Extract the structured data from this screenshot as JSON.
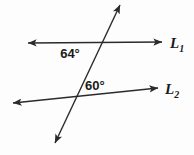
{
  "figure": {
    "kind": "two-parallel-lines-cut-by-transversal",
    "background_color": "#fdfdfd",
    "stroke_color": "#2b2b2b",
    "text_color": "#1a1a1a",
    "angles": [
      {
        "id": "angle-64",
        "value": "64",
        "degree_symbol": "°",
        "label": "64°",
        "x": 70,
        "y": 58,
        "position_note": "below line L1, left of transversal"
      },
      {
        "id": "angle-60",
        "value": "60",
        "degree_symbol": "°",
        "label": "60°",
        "x": 85,
        "y": 90,
        "position_note": "above line L2, right of transversal"
      }
    ],
    "lines": [
      {
        "id": "line-L1",
        "label_base": "L",
        "label_sub": "1",
        "label": "L₁",
        "label_x": 170,
        "label_y": 48,
        "x1": 28,
        "y1": 43,
        "x2": 162,
        "y2": 42,
        "arrow_start": true,
        "arrow_end": true
      },
      {
        "id": "line-L2",
        "label_base": "L",
        "label_sub": "2",
        "label": "L₂",
        "label_x": 165,
        "label_y": 94,
        "x1": 13,
        "y1": 103,
        "x2": 158,
        "y2": 88,
        "arrow_start": true,
        "arrow_end": true
      },
      {
        "id": "line-transversal",
        "label_base": "",
        "label_sub": "",
        "label": "",
        "label_x": 0,
        "label_y": 0,
        "x1": 55,
        "y1": 143,
        "x2": 120,
        "y2": 5,
        "arrow_start": true,
        "arrow_end": true
      }
    ]
  }
}
